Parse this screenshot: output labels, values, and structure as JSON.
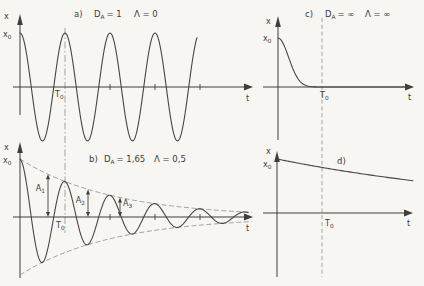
{
  "meta": {
    "background": "#f7f6f3",
    "ink": "#3e3e3e",
    "guide_color": "#9a9a98"
  },
  "panels": {
    "a": {
      "tag": "a)",
      "d_sym": "D",
      "d_sub": "A",
      "d_val": "= 1",
      "l_val": "Λ = 0",
      "x_label": "x",
      "x0_main": "x",
      "x0_sub": "0",
      "T0_main": "T",
      "T0_sub": "0",
      "t_label": "t"
    },
    "b": {
      "tag": "b)",
      "d_sym": "D",
      "d_sub": "A",
      "d_val": "= 1,65",
      "l_val": "Λ = 0,5",
      "x_label": "x",
      "x0_main": "x",
      "x0_sub": "0",
      "T0_main": "T",
      "T0_sub": "0",
      "t_label": "t",
      "amp_labels": [
        {
          "main": "A",
          "sub": "1"
        },
        {
          "main": "A",
          "sub": "2"
        },
        {
          "main": "A",
          "sub": "3"
        }
      ]
    },
    "c": {
      "tag": "c)",
      "d_sym": "D",
      "d_sub": "A",
      "d_val": "= ∞",
      "l_val": "Λ = ∞",
      "x_label": "x",
      "x0_main": "x",
      "x0_sub": "0",
      "T0_main": "T",
      "T0_sub": "0",
      "t_label": "t"
    },
    "d": {
      "tag": "d)",
      "x_label": "x",
      "x0_main": "x",
      "x0_sub": "0",
      "T0_main": "T",
      "T0_sub": "0",
      "t_label": "t"
    }
  },
  "curves": {
    "a": {
      "shape": "cosine",
      "x_start": 20,
      "x_end": 197,
      "axis_y": 87,
      "amplitude": 54,
      "period_px": 45,
      "axis_ticks_x": [
        110,
        155,
        200
      ]
    },
    "b": {
      "shape": "damped_cosine",
      "x_start": 20,
      "x_end": 248,
      "axis_y": 217,
      "amplitude": 58,
      "period_px": 45,
      "decay_per_px": 0.0109,
      "envelope_x_end": 252,
      "amplitude_arrows_x": [
        48,
        88,
        120
      ],
      "axis_ticks_x": [
        110,
        155,
        200
      ]
    },
    "c": {
      "shape": "bell_decay",
      "x_start": 278,
      "x_end": 410,
      "axis_y": 87,
      "amplitude": 49,
      "sigma_px": 15
    },
    "d": {
      "shape": "exp_decay",
      "x_start": 277,
      "x_end": 414,
      "axis_y": 213,
      "amplitude": 54,
      "tau_px": 265
    }
  }
}
